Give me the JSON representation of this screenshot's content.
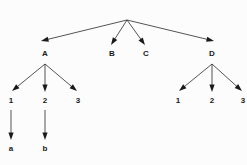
{
  "diagram": {
    "type": "tree",
    "title": "",
    "background_color": "#fcfcfc",
    "edge_color": "#2a2a2a",
    "label_color": "#1a1a1a",
    "nodes": [
      {
        "id": "root",
        "label": "",
        "x": 127,
        "y": 19,
        "level": 0,
        "visible_label": false
      },
      {
        "id": "A",
        "label": "A",
        "x": 45,
        "y": 56,
        "level": 1,
        "visible_label": true
      },
      {
        "id": "B",
        "label": "B",
        "x": 112,
        "y": 56,
        "level": 1,
        "visible_label": true
      },
      {
        "id": "C",
        "label": "C",
        "x": 146,
        "y": 56,
        "level": 1,
        "visible_label": true
      },
      {
        "id": "D",
        "label": "D",
        "x": 212,
        "y": 56,
        "level": 1,
        "visible_label": true
      },
      {
        "id": "A1",
        "label": "1",
        "x": 11,
        "y": 103,
        "level": 2,
        "visible_label": true
      },
      {
        "id": "A2",
        "label": "2",
        "x": 45,
        "y": 103,
        "level": 2,
        "visible_label": true
      },
      {
        "id": "A3",
        "label": "3",
        "x": 78,
        "y": 103,
        "level": 2,
        "visible_label": true
      },
      {
        "id": "D1",
        "label": "1",
        "x": 178,
        "y": 103,
        "level": 2,
        "visible_label": true
      },
      {
        "id": "D2",
        "label": "2",
        "x": 212,
        "y": 103,
        "level": 2,
        "visible_label": true
      },
      {
        "id": "D3",
        "label": "3",
        "x": 243,
        "y": 103,
        "level": 2,
        "visible_label": true
      },
      {
        "id": "a",
        "label": "a",
        "x": 11,
        "y": 151,
        "level": 3,
        "visible_label": true
      },
      {
        "id": "b",
        "label": "b",
        "x": 45,
        "y": 151,
        "level": 3,
        "visible_label": true
      }
    ],
    "edges": [
      {
        "from": "root",
        "to": "A",
        "x1": 127,
        "y1": 20,
        "x2": 41,
        "y2": 41,
        "arrow": true
      },
      {
        "from": "root",
        "to": "B",
        "x1": 127,
        "y1": 20,
        "x2": 111,
        "y2": 45,
        "arrow": true
      },
      {
        "from": "root",
        "to": "C",
        "x1": 127,
        "y1": 20,
        "x2": 145,
        "y2": 45,
        "arrow": true
      },
      {
        "from": "root",
        "to": "D",
        "x1": 127,
        "y1": 20,
        "x2": 214,
        "y2": 41,
        "arrow": true
      },
      {
        "from": "A",
        "to": "A1",
        "x1": 45,
        "y1": 64,
        "x2": 12,
        "y2": 91,
        "arrow": true
      },
      {
        "from": "A",
        "to": "A2",
        "x1": 45,
        "y1": 64,
        "x2": 45,
        "y2": 92,
        "arrow": true
      },
      {
        "from": "A",
        "to": "A3",
        "x1": 45,
        "y1": 64,
        "x2": 77,
        "y2": 91,
        "arrow": true
      },
      {
        "from": "D",
        "to": "D1",
        "x1": 212,
        "y1": 64,
        "x2": 179,
        "y2": 91,
        "arrow": true
      },
      {
        "from": "D",
        "to": "D2",
        "x1": 212,
        "y1": 64,
        "x2": 212,
        "y2": 92,
        "arrow": true
      },
      {
        "from": "D",
        "to": "D3",
        "x1": 212,
        "y1": 64,
        "x2": 242,
        "y2": 91,
        "arrow": true
      },
      {
        "from": "A1",
        "to": "a",
        "x1": 11,
        "y1": 110,
        "x2": 11,
        "y2": 140,
        "arrow": true
      },
      {
        "from": "A2",
        "to": "b",
        "x1": 45,
        "y1": 110,
        "x2": 45,
        "y2": 140,
        "arrow": true
      }
    ]
  }
}
